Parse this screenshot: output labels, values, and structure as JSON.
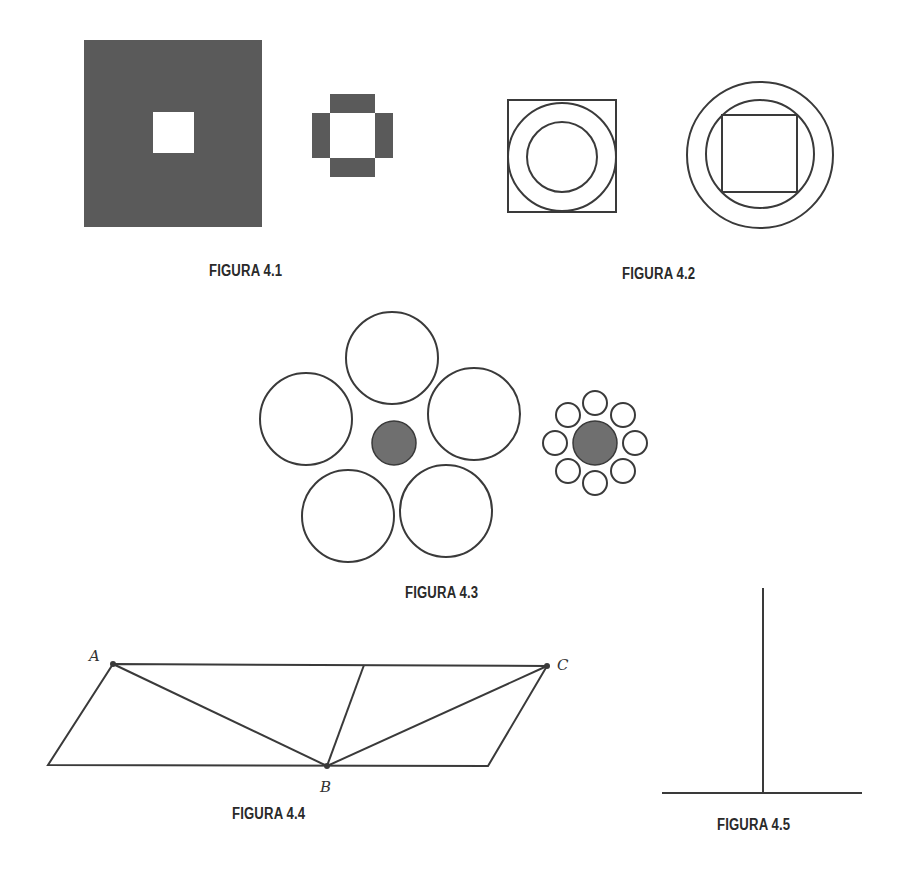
{
  "figures": [
    {
      "id": "4.1",
      "caption": "FIGURA 4.1",
      "description": "Large dark square with small white square hole; small white square bordered by four dark bars"
    },
    {
      "id": "4.2",
      "caption": "FIGURA 4.2",
      "description": "Circle ring inscribed in square; square inscribed in circle ring"
    },
    {
      "id": "4.3",
      "caption": "FIGURA 4.3",
      "description": "Ebbinghaus illusion: gray circle surrounded by large circles vs same gray circle surrounded by small circles"
    },
    {
      "id": "4.4",
      "caption": "FIGURA 4.4",
      "description": "Sander parallelogram illusion with points A, B, C"
    },
    {
      "id": "4.5",
      "caption": "FIGURA 4.5",
      "description": "Vertical-horizontal illusion (inverted T)"
    }
  ],
  "points": {
    "a": "A",
    "b": "B",
    "c": "C"
  },
  "colors": {
    "fill_dark": "#5a5a5a",
    "fill_gray": "#6f6f6f",
    "stroke": "#3a3a3a",
    "background": "#ffffff"
  }
}
